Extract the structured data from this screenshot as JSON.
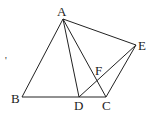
{
  "diagram": {
    "type": "geometry",
    "points": {
      "A": {
        "x": 63,
        "y": 19,
        "label": "A",
        "lx": 57,
        "ly": 16
      },
      "B": {
        "x": 22,
        "y": 97,
        "label": "B",
        "lx": 11,
        "ly": 103
      },
      "C": {
        "x": 106,
        "y": 97,
        "label": "C",
        "lx": 102,
        "ly": 110
      },
      "D": {
        "x": 79,
        "y": 97,
        "label": "D",
        "lx": 74,
        "ly": 110
      },
      "E": {
        "x": 136,
        "y": 45,
        "label": "E",
        "lx": 138,
        "ly": 50
      },
      "F": {
        "x": 97,
        "y": 78,
        "label": "F",
        "lx": 95,
        "ly": 75
      }
    },
    "segments": [
      [
        "A",
        "B"
      ],
      [
        "A",
        "D"
      ],
      [
        "A",
        "C"
      ],
      [
        "A",
        "E"
      ],
      [
        "B",
        "C"
      ],
      [
        "D",
        "E"
      ],
      [
        "C",
        "E"
      ]
    ],
    "stray_mark": {
      "x": 5,
      "y": 64,
      "text": "'"
    }
  }
}
